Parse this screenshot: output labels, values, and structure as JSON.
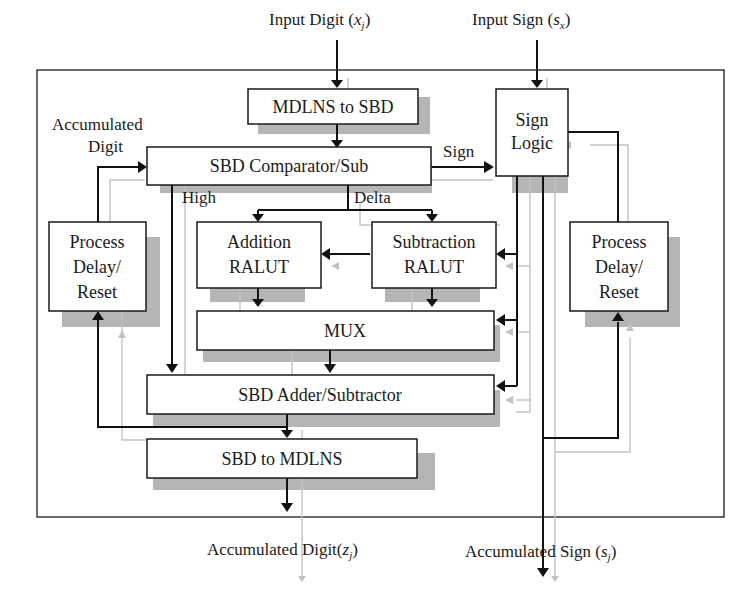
{
  "diagram": {
    "type": "block-diagram",
    "external_labels": {
      "input_digit": "Input Digit",
      "input_digit_var": "x",
      "input_digit_sub": "j",
      "input_sign": "Input Sign",
      "input_sign_var": "s",
      "input_sign_sub": "x",
      "output_digit": "Accumulated Digit",
      "output_digit_var": "z",
      "output_digit_sub": "j",
      "output_sign": "Accumulated Sign",
      "output_sign_var": "s",
      "output_sign_sub": "j"
    },
    "internal_labels": {
      "accumulated_digit_line1": "Accumulated",
      "accumulated_digit_line2": "Digit",
      "sign": "Sign",
      "high": "High",
      "delta": "Delta"
    },
    "blocks": {
      "mdlns_to_sbd": "MDLNS to SBD",
      "sign_logic_line1": "Sign",
      "sign_logic_line2": "Logic",
      "comparator": "SBD Comparator/Sub",
      "addition_line1": "Addition",
      "addition_line2": "RALUT",
      "subtraction_line1": "Subtraction",
      "subtraction_line2": "RALUT",
      "delay_left_line1": "Process",
      "delay_left_line2": "Delay/",
      "delay_left_line3": "Reset",
      "delay_right_line1": "Process",
      "delay_right_line2": "Delay/",
      "delay_right_line3": "Reset",
      "mux": "MUX",
      "adder": "SBD Adder/Subtractor",
      "sbd_to_mdlns": "SBD to MDLNS"
    },
    "colors": {
      "line": "#111111",
      "control_line": "#c2c2c2",
      "shadow": "#b5b5b5",
      "block_fill": "#ffffff"
    }
  }
}
